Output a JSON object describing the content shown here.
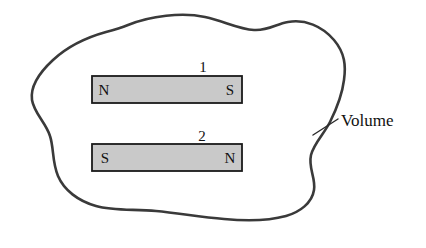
{
  "figure": {
    "background_color": "#ffffff",
    "outline_color": "#3a3a3a",
    "outline_width": 2.6,
    "width": 426,
    "height": 248
  },
  "volume": {
    "label": "Volume",
    "leader_line": {
      "from_x": 313,
      "from_y": 135,
      "to_x": 338,
      "to_y": 119
    },
    "label_x": 341,
    "label_y": 126
  },
  "magnets": [
    {
      "index_label": "1",
      "index_x": 203,
      "index_y": 72,
      "left_pole": "N",
      "right_pole": "S",
      "x": 92,
      "y": 76,
      "width": 150,
      "height": 27,
      "fill_color": "#c9c9c9",
      "stroke_color": "#1a1a1a",
      "left_pole_x": 104,
      "right_pole_x": 230,
      "pole_y": 95
    },
    {
      "index_label": "2",
      "index_x": 202,
      "index_y": 141,
      "left_pole": "S",
      "right_pole": "N",
      "x": 92,
      "y": 144,
      "width": 150,
      "height": 27,
      "fill_color": "#c9c9c9",
      "stroke_color": "#1a1a1a",
      "left_pole_x": 105,
      "right_pole_x": 230,
      "pole_y": 163
    }
  ],
  "outline_path": "M 128,25 C 150,16 182,12 205,17 C 224,21 238,29 254,30 C 268,31 276,24 288,22 C 305,19 322,26 334,40 C 345,53 346,66 344,80 C 342,96 336,110 330,122 C 324,134 314,143 311,155 C 308,168 316,178 314,190 C 312,203 300,212 286,216 C 268,221 246,221 224,219 C 200,217 178,213 156,211 C 134,209 113,211 96,206 C 78,201 64,190 58,176 C 52,162 54,148 50,136 C 46,123 34,113 32,100 C 30,86 40,72 53,60 C 68,46 88,37 106,32 C 114,30 121,28 128,25 Z"
}
